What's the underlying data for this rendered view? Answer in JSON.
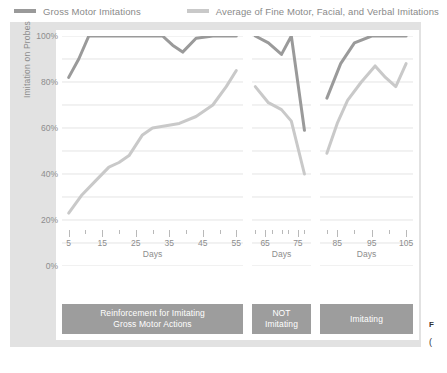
{
  "legend": {
    "entries": [
      {
        "label": "Gross Motor Imitations",
        "color": "#9a9a9a",
        "icon": "line-swatch-icon"
      },
      {
        "label": "Average of Fine Motor, Facial, and Verbal Imitations",
        "color": "#c9c9c9",
        "icon": "line-swatch-icon"
      }
    ]
  },
  "caption": {
    "line1": "F",
    "line2": "("
  },
  "chart_data": {
    "type": "line",
    "title": "",
    "xlabel": "Days",
    "ylabel": "Imitation on Probes",
    "ylim": [
      0,
      100
    ],
    "ytick_labels": [
      "0%",
      "20%",
      "40%",
      "60%",
      "80%",
      "100%"
    ],
    "ytick_values": [
      0,
      20,
      40,
      60,
      80,
      100
    ],
    "grid": true,
    "legend_position": "top",
    "series_names": [
      "Gross Motor Imitations",
      "Average of Fine Motor, Facial, and Verbal Imitations"
    ],
    "series_colors": [
      "#9a9a9a",
      "#c9c9c9"
    ],
    "panels": [
      {
        "name": "Reinforcement for Imitating Gross Motor Actions",
        "condition_label": "Reinforcement for Imitating\nGross Motor Actions",
        "xlim": [
          3,
          57
        ],
        "xtick_labels": [
          "5",
          "15",
          "25",
          "35",
          "45",
          "55"
        ],
        "xtick_values": [
          5,
          15,
          25,
          35,
          45,
          55
        ],
        "xminor_values": [
          10,
          20,
          30,
          40,
          50
        ],
        "xlabel": "Days",
        "series": [
          {
            "name": "Gross Motor Imitations",
            "x": [
              5,
              8,
              11,
              16,
              22,
              28,
              33,
              36,
              39,
              43,
              48,
              52,
              55
            ],
            "values": [
              82,
              90,
              100,
              100,
              100,
              100,
              100,
              96,
              93,
              99,
              100,
              100,
              100
            ]
          },
          {
            "name": "Average of Fine Motor, Facial, and Verbal Imitations",
            "x": [
              5,
              9,
              13,
              17,
              20,
              23,
              27,
              30,
              34,
              38,
              43,
              48,
              52,
              55
            ],
            "values": [
              23,
              31,
              37,
              43,
              45,
              48,
              57,
              60,
              61,
              62,
              65,
              70,
              78,
              85
            ]
          }
        ]
      },
      {
        "name": "NOT Imitating",
        "condition_label": "NOT\nImitating",
        "xlim": [
          61,
          79
        ],
        "xtick_labels": [
          "65",
          "75"
        ],
        "xtick_values": [
          65,
          75
        ],
        "xminor_values": [
          62,
          67,
          70,
          72,
          77
        ],
        "xlabel": "Days",
        "series": [
          {
            "name": "Gross Motor Imitations",
            "x": [
              62,
              66,
              70,
              73,
              77
            ],
            "values": [
              100,
              97,
              92,
              100,
              59
            ]
          },
          {
            "name": "Average of Fine Motor, Facial, and Verbal Imitations",
            "x": [
              62,
              66,
              70,
              73,
              77
            ],
            "values": [
              78,
              71,
              68,
              63,
              40
            ]
          }
        ]
      },
      {
        "name": "Imitating",
        "condition_label": "Imitating",
        "xlim": [
          80,
          107
        ],
        "xtick_labels": [
          "85",
          "95",
          "105"
        ],
        "xtick_values": [
          85,
          95,
          105
        ],
        "xminor_values": [
          82,
          90,
          100
        ],
        "xlabel": "Days",
        "series": [
          {
            "name": "Gross Motor Imitations",
            "x": [
              82,
              86,
              90,
              95,
              100,
              105
            ],
            "values": [
              73,
              88,
              97,
              100,
              100,
              100
            ]
          },
          {
            "name": "Average of Fine Motor, Facial, and Verbal Imitations",
            "x": [
              82,
              85,
              88,
              92,
              96,
              99,
              102,
              105
            ],
            "values": [
              49,
              62,
              72,
              80,
              87,
              82,
              78,
              88
            ]
          }
        ]
      }
    ]
  }
}
